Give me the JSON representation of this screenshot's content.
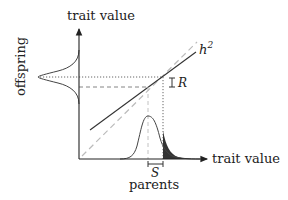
{
  "diagram": {
    "y_axis_label": "trait value",
    "x_axis_label": "trait value",
    "offspring_label": "offspring",
    "parents_label": "parents",
    "heritability_label": "h",
    "heritability_sup": "2",
    "response_label": "R",
    "selection_label": "S",
    "colors": {
      "axis": "#222222",
      "regression_line": "#333333",
      "identity_line": "#bbbbbb",
      "guide_lines": "#666666",
      "selected_fill": "#333333"
    }
  }
}
